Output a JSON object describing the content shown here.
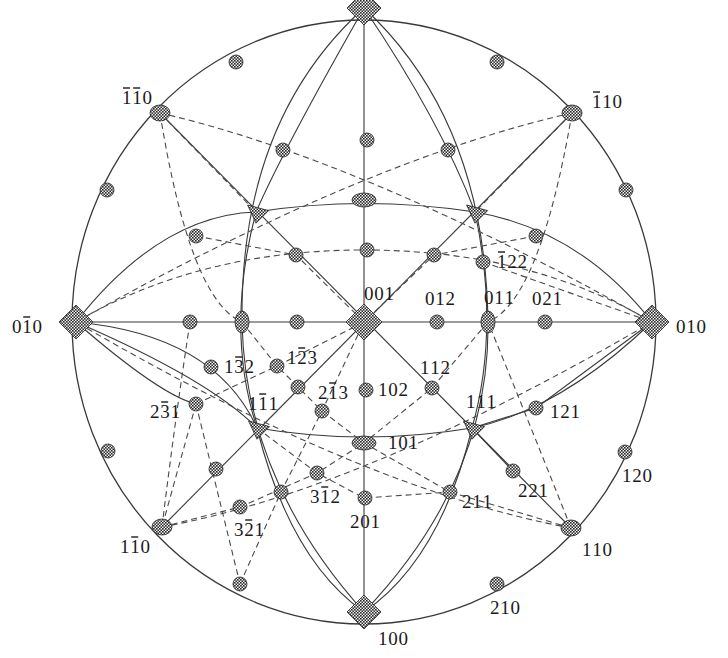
{
  "diagram": {
    "center": [
      364,
      322
    ],
    "radius": [
      292,
      302
    ],
    "colors": {
      "line": "#3a3a3a",
      "pole_fill": "#555555",
      "text": "#1a1a1a",
      "background": "#ffffff"
    },
    "poles": [
      {
        "id": "001",
        "label": "001",
        "shape": "diamond",
        "x": 364,
        "y": 322,
        "size": 18,
        "lx": 364,
        "ly": 300,
        "anchor": "start",
        "ldx": 0
      },
      {
        "id": "t100",
        "label": "",
        "shape": "diamond",
        "x": 364,
        "y": 8,
        "size": 17,
        "lx": 0,
        "ly": 0
      },
      {
        "id": "100",
        "label": "100",
        "shape": "diamond",
        "x": 364,
        "y": 612,
        "size": 17,
        "lx": 378,
        "ly": 645,
        "anchor": "start"
      },
      {
        "id": "0-10",
        "label": "0İ1̄0",
        "display": "0̅0",
        "shape": "diamond",
        "x": 76,
        "y": 322,
        "size": 17,
        "lx": 12,
        "ly": 333,
        "anchor": "start"
      },
      {
        "id": "010",
        "label": "010",
        "shape": "diamond",
        "x": 652,
        "y": 322,
        "size": 17,
        "lx": 676,
        "ly": 333,
        "anchor": "start"
      },
      {
        "id": "-1-10",
        "label": "̅1̅1 0",
        "shape": "ellipse",
        "x": 160,
        "y": 113,
        "rx": 10,
        "ry": 8,
        "lx": 122,
        "ly": 104,
        "anchor": "start"
      },
      {
        "id": "-110",
        "label": "̅1 10",
        "shape": "ellipse",
        "x": 572,
        "y": 113,
        "rx": 10,
        "ry": 8,
        "lx": 592,
        "ly": 108,
        "anchor": "start"
      },
      {
        "id": "1-10",
        "label": "1̅1 0",
        "shape": "ellipse",
        "x": 162,
        "y": 527,
        "rx": 10,
        "ry": 8,
        "lx": 120,
        "ly": 553,
        "anchor": "start"
      },
      {
        "id": "110",
        "label": "110",
        "shape": "ellipse",
        "x": 571,
        "y": 528,
        "rx": 10,
        "ry": 8,
        "lx": 582,
        "ly": 556,
        "anchor": "start"
      },
      {
        "id": "011",
        "label": "011",
        "shape": "ellipse",
        "x": 488,
        "y": 322,
        "rx": 7,
        "ry": 11,
        "lx": 484,
        "ly": 304,
        "anchor": "start"
      },
      {
        "id": "101",
        "label": "101",
        "shape": "ellipse",
        "x": 364,
        "y": 443,
        "rx": 12,
        "ry": 7,
        "lx": 388,
        "ly": 449,
        "anchor": "start"
      },
      {
        "id": "0-11",
        "label": "",
        "shape": "ellipse",
        "x": 242,
        "y": 322,
        "rx": 7,
        "ry": 11
      },
      {
        "id": "-101",
        "label": "",
        "shape": "ellipse",
        "x": 364,
        "y": 200,
        "rx": 12,
        "ry": 7
      },
      {
        "id": "111",
        "label": "111",
        "shape": "triangle",
        "x": 472,
        "y": 428,
        "size": 14,
        "lx": 466,
        "ly": 408,
        "anchor": "start"
      },
      {
        "id": "1-11",
        "label": "1̅1 1",
        "shape": "triangle",
        "x": 257,
        "y": 428,
        "size": 14,
        "lx": 248,
        "ly": 410,
        "anchor": "start"
      },
      {
        "id": "-111",
        "label": "",
        "shape": "triangle",
        "x": 475,
        "y": 212,
        "size": 14
      },
      {
        "id": "-1-11",
        "label": "",
        "shape": "triangle",
        "x": 256,
        "y": 212,
        "size": 14
      },
      {
        "id": "012",
        "label": "012",
        "shape": "circle",
        "x": 437,
        "y": 322,
        "r": 7,
        "lx": 425,
        "ly": 305,
        "anchor": "start"
      },
      {
        "id": "021",
        "label": "021",
        "shape": "circle",
        "x": 545,
        "y": 322,
        "r": 7,
        "lx": 532,
        "ly": 305,
        "anchor": "start"
      },
      {
        "id": "0-12",
        "label": "",
        "shape": "circle",
        "x": 297,
        "y": 322,
        "r": 7
      },
      {
        "id": "0-21",
        "label": "",
        "shape": "circle",
        "x": 190,
        "y": 322,
        "r": 7
      },
      {
        "id": "102",
        "label": "102",
        "shape": "circle",
        "x": 366,
        "y": 390,
        "r": 7,
        "lx": 378,
        "ly": 396,
        "anchor": "start"
      },
      {
        "id": "201",
        "label": "201",
        "shape": "circle",
        "x": 365,
        "y": 498,
        "r": 7,
        "lx": 350,
        "ly": 528,
        "anchor": "start"
      },
      {
        "id": "-102",
        "label": "",
        "shape": "circle",
        "x": 367,
        "y": 250,
        "r": 7
      },
      {
        "id": "-201",
        "label": "",
        "shape": "circle",
        "x": 367,
        "y": 140,
        "r": 7
      },
      {
        "id": "112",
        "label": "112",
        "shape": "circle",
        "x": 432,
        "y": 388,
        "r": 7,
        "lx": 420,
        "ly": 374,
        "anchor": "start"
      },
      {
        "id": "121",
        "label": "121",
        "shape": "circle",
        "x": 536,
        "y": 408,
        "r": 7,
        "lx": 550,
        "ly": 418,
        "anchor": "start"
      },
      {
        "id": "211",
        "label": "211",
        "shape": "circle",
        "x": 450,
        "y": 492,
        "r": 7,
        "lx": 462,
        "ly": 508,
        "anchor": "start"
      },
      {
        "id": "221",
        "label": "221",
        "shape": "circle",
        "x": 513,
        "y": 471,
        "r": 7,
        "lx": 518,
        "ly": 497,
        "anchor": "start"
      },
      {
        "id": "120",
        "label": "120",
        "shape": "circle",
        "x": 625,
        "y": 452,
        "r": 7,
        "lx": 622,
        "ly": 482,
        "anchor": "start"
      },
      {
        "id": "210",
        "label": "210",
        "shape": "circle",
        "x": 497,
        "y": 584,
        "r": 7,
        "lx": 490,
        "ly": 614,
        "anchor": "start"
      },
      {
        "id": "-122",
        "label": "̅1 22",
        "shape": "circle",
        "x": 483,
        "y": 262,
        "r": 7,
        "lx": 497,
        "ly": 268,
        "anchor": "start"
      },
      {
        "id": "-122b",
        "label": "",
        "shape": "circle",
        "x": 536,
        "y": 236,
        "r": 7
      },
      {
        "id": "-112",
        "label": "",
        "shape": "circle",
        "x": 434,
        "y": 255,
        "r": 7
      },
      {
        "id": "-1-12",
        "label": "",
        "shape": "circle",
        "x": 296,
        "y": 255,
        "r": 7
      },
      {
        "id": "-1-21",
        "label": "",
        "shape": "circle",
        "x": 196,
        "y": 236,
        "r": 7
      },
      {
        "id": "-2-11",
        "label": "",
        "shape": "circle",
        "x": 283,
        "y": 150,
        "r": 7
      },
      {
        "id": "-211",
        "label": "",
        "shape": "circle",
        "x": 448,
        "y": 150,
        "r": 7
      },
      {
        "id": "-210",
        "label": "",
        "shape": "circle",
        "x": 497,
        "y": 62,
        "r": 7
      },
      {
        "id": "-2-10",
        "label": "",
        "shape": "circle",
        "x": 236,
        "y": 62,
        "r": 7
      },
      {
        "id": "-120",
        "label": "",
        "shape": "circle",
        "x": 626,
        "y": 190,
        "r": 7
      },
      {
        "id": "-1-20",
        "label": "",
        "shape": "circle",
        "x": 107,
        "y": 190,
        "r": 7
      },
      {
        "id": "1-32",
        "label": "1̅3 2",
        "shape": "circle",
        "x": 211,
        "y": 367,
        "r": 7,
        "lx": 224,
        "ly": 373,
        "anchor": "start"
      },
      {
        "id": "1-23",
        "label": "1̅2 3",
        "shape": "circle",
        "x": 277,
        "y": 366,
        "r": 7,
        "lx": 287,
        "ly": 364,
        "anchor": "start"
      },
      {
        "id": "1-12",
        "label": "",
        "shape": "circle",
        "x": 298,
        "y": 387,
        "r": 7
      },
      {
        "id": "2-13",
        "label": "2̅1 3",
        "shape": "circle",
        "x": 322,
        "y": 411,
        "r": 7,
        "lx": 318,
        "ly": 399,
        "anchor": "start"
      },
      {
        "id": "2-31",
        "label": "2̅3 1",
        "shape": "circle",
        "x": 196,
        "y": 404,
        "r": 7,
        "lx": 150,
        "ly": 418,
        "anchor": "start"
      },
      {
        "id": "1-21",
        "label": "",
        "shape": "circle",
        "x": 216,
        "y": 469,
        "r": 7
      },
      {
        "id": "3-12",
        "label": "3̅1 2",
        "shape": "circle",
        "x": 317,
        "y": 473,
        "r": 7,
        "lx": 310,
        "ly": 503,
        "anchor": "start"
      },
      {
        "id": "2-11",
        "label": "",
        "shape": "circle",
        "x": 281,
        "y": 492,
        "r": 7
      },
      {
        "id": "3-21",
        "label": "3̅2 1",
        "shape": "circle",
        "x": 240,
        "y": 507,
        "r": 7,
        "lx": 234,
        "ly": 536,
        "anchor": "start"
      },
      {
        "id": "2-10",
        "label": "",
        "shape": "circle",
        "x": 240,
        "y": 584,
        "r": 7
      },
      {
        "id": "1-20",
        "label": "",
        "shape": "circle",
        "x": 108,
        "y": 451,
        "r": 7
      }
    ],
    "solid_paths": [
      "M 364 8 L 364 612",
      "M 76 322 L 652 322",
      "M 160 113 L 571 528",
      "M 572 113 L 162 527",
      "M 76 322 Q 160 215 256 212 Q 364 195 475 212 Q 580 230 652 322",
      "M 76 322 Q 215 335 257 428 M 257 428 Q 364 446 472 428 Q 560 410 652 322",
      "M 364 8 Q 240 120 242 322 Q 245 480 364 612",
      "M 364 8 Q 485 120 488 322 Q 490 480 364 612",
      "M 76 322 Q 210 380 257 428",
      "M 364 612 Q 290 560 257 428 Q 225 330 256 212 Q 283 150 364 8",
      "M 364 612 Q 440 560 472 428 Q 500 330 475 212 Q 440 120 364 8",
      "M 472 428 L 536 408 L 652 322",
      "M 472 428 L 513 471",
      "M 76 322 Q 160 395 196 404"
    ],
    "dashed_paths": [
      "M 160 113 Q 364 160 652 322",
      "M 572 113 Q 364 160 76 322",
      "M 162 527 Q 364 490 652 322",
      "M 571 528 Q 364 490 76 322",
      "M 160 113 L 256 212 M 160 113 Q 190 300 242 322",
      "M 572 113 L 475 212 M 572 113 Q 540 300 488 322",
      "M 162 527 Q 175 420 190 322 M 162 527 L 240 507 L 317 473 L 364 443",
      "M 571 528 L 450 492 L 364 443 M 571 528 Q 520 400 488 322",
      "M 76 322 Q 200 250 364 250 Q 530 250 652 322",
      "M 242 322 L 277 366 L 322 411 L 364 443",
      "M 488 322 L 432 388 L 364 443",
      "M 196 404 L 277 366 L 364 322",
      "M 196 404 L 162 527 M 196 404 L 240 584",
      "M 240 584 L 281 492 L 322 411 L 364 322",
      "M 257 428 L 317 473 L 364 498 L 450 492",
      "M 196 236 L 296 255 L 364 322 M 536 236 L 434 255 L 364 322",
      "M 483 262 L 652 322"
    ]
  }
}
